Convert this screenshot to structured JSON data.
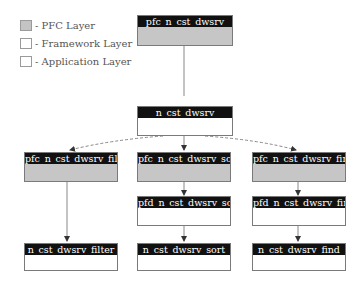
{
  "legend": {
    "items": [
      {
        "label": "- PFC Layer",
        "kind": "pfc",
        "color": "#c4c4c4"
      },
      {
        "label": "- Framework Layer",
        "kind": "fw",
        "color": "#ffffff"
      },
      {
        "label": "- Application Layer",
        "kind": "app",
        "color": "#ffffff"
      }
    ]
  },
  "nodes": {
    "root": {
      "label": "pfc_n_cst_dwsrv",
      "layer": "pfc"
    },
    "base": {
      "label": "n_cst_dwsrv",
      "layer": "framework"
    },
    "pfc_filter": {
      "label": "pfc_n_cst_dwsrv_filter",
      "layer": "pfc"
    },
    "pfc_sort": {
      "label": "pfc_n_cst_dwsrv_sort",
      "layer": "pfc"
    },
    "pfc_find": {
      "label": "pfc_n_cst_dwsrv_find",
      "layer": "pfc"
    },
    "pfd_sort": {
      "label": "pfd_n_cst_dwsrv_sort",
      "layer": "framework"
    },
    "pfd_find": {
      "label": "pfd_n_cst_dwsrv_find",
      "layer": "framework"
    },
    "app_filter": {
      "label": "n_cst_dwsrv_filter",
      "layer": "application"
    },
    "app_sort": {
      "label": "n_cst_dwsrv_sort",
      "layer": "application"
    },
    "app_find": {
      "label": "n_cst_dwsrv_find",
      "layer": "application"
    }
  },
  "colors": {
    "header": "#111111",
    "pfc_body": "#c6c6c6",
    "line": "#777777"
  }
}
